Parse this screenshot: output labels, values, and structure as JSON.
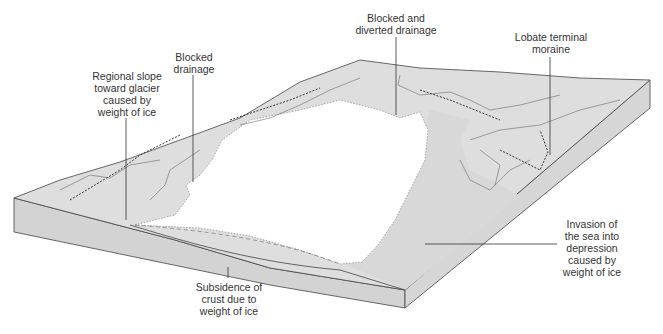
{
  "diagram": {
    "colors": {
      "land": "#dedede",
      "land_side": "#d3d3d3",
      "ice": "#ffffff",
      "outline": "#444444",
      "label_text": "#333333"
    },
    "labels": [
      {
        "id": "regional-slope",
        "text": "Regional slope\ntoward glacier\ncaused by\nweight of ice"
      },
      {
        "id": "blocked-drainage",
        "text": "Blocked\ndrainage"
      },
      {
        "id": "blocked-diverted-drainage",
        "text": "Blocked and\ndiverted drainage"
      },
      {
        "id": "lobate-terminal-moraine",
        "text": "Lobate terminal\nmoraine"
      },
      {
        "id": "invasion-of-sea",
        "text": "Invasion of\nthe sea into\ndepression\ncaused by\nweight of ice"
      },
      {
        "id": "subsidence-of-crust",
        "text": "Subsidence of\ncrust due to\nweight of ice"
      }
    ]
  }
}
